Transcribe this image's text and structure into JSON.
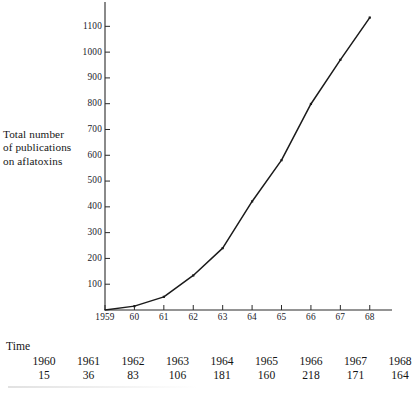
{
  "chart_data": {
    "type": "line",
    "title": "",
    "subtitle": "",
    "xlabel": "",
    "ylabel": "Total number of publications on aflatoxins",
    "ylabel_lines": [
      "Total number",
      "of publications",
      "on aflatoxins"
    ],
    "x": [
      1959,
      1960,
      1961,
      1962,
      1963,
      1964,
      1965,
      1966,
      1967,
      1968
    ],
    "x_tick_labels": [
      "1959",
      "60",
      "61",
      "62",
      "63",
      "64",
      "65",
      "66",
      "67",
      "68"
    ],
    "y_tick_labels": [
      "100",
      "200",
      "300",
      "400",
      "500",
      "600",
      "700",
      "800",
      "900",
      "1000",
      "1100"
    ],
    "y_ticks": [
      100,
      200,
      300,
      400,
      500,
      600,
      700,
      800,
      900,
      1000,
      1100
    ],
    "values": [
      0,
      15,
      51,
      134,
      240,
      421,
      581,
      799,
      970,
      1134
    ],
    "series": [
      {
        "name": "Cumulative publications on aflatoxins",
        "values": [
          0,
          15,
          51,
          134,
          240,
          421,
          581,
          799,
          970,
          1134
        ]
      }
    ],
    "xlim": [
      1959,
      1968.4
    ],
    "ylim": [
      0,
      1175
    ],
    "grid": false,
    "legend": false,
    "markers": true,
    "line_color": "#1b1b1b",
    "axis_color": "#2a2a2a"
  },
  "table": {
    "heading": "Time",
    "columns": [
      "1960",
      "1961",
      "1962",
      "1963",
      "1964",
      "1965",
      "1966",
      "1967",
      "1968"
    ],
    "values": [
      "15",
      "36",
      "83",
      "106",
      "181",
      "160",
      "218",
      "171",
      "164"
    ]
  }
}
